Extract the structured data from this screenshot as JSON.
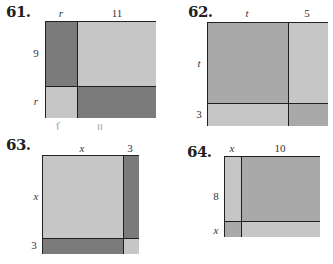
{
  "figures": [
    {
      "number": "61.",
      "top_labels": [
        "r",
        "11"
      ],
      "side_labels": [
        "9",
        "r"
      ],
      "pencil_marks": [
        "ſ",
        "ıı"
      ]
    },
    {
      "number": "62.",
      "top_labels": [
        "t",
        "5"
      ],
      "side_labels": [
        "t",
        "3"
      ]
    },
    {
      "number": "63.",
      "top_labels": [
        "x",
        "3"
      ],
      "side_labels": [
        "x",
        "3"
      ]
    },
    {
      "number": "64.",
      "top_labels": [
        "x",
        "10"
      ],
      "side_labels": [
        "8",
        "x"
      ]
    }
  ],
  "colors": {
    "dark": "#7b7b7b",
    "medium": "#a9a9a9",
    "light": "#c6c6c6",
    "border": "#222222"
  }
}
